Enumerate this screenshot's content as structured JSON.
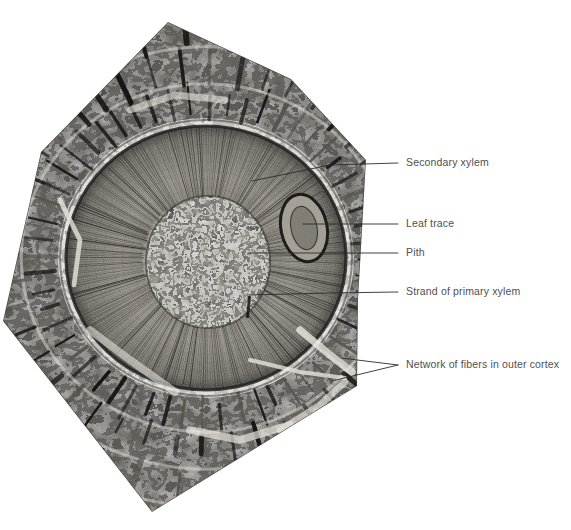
{
  "figure": {
    "kind": "fossil-cross-section-photomicrograph",
    "background_color": "#ffffff",
    "label_color": "#4f4f4f",
    "leader_color": "#2b2b2b",
    "specimen": {
      "shape": "hexagonal-slab",
      "tone_dark": "#1b1b1b",
      "tone_mid": "#7a7a7a",
      "tone_light": "#e6e4de",
      "outline": [
        [
          168,
          22
        ],
        [
          291,
          79
        ],
        [
          366,
          160
        ],
        [
          358,
          300
        ],
        [
          357,
          386
        ],
        [
          152,
          512
        ],
        [
          3,
          321
        ],
        [
          41,
          152
        ]
      ]
    },
    "regions": {
      "pith": {
        "cx": 208,
        "cy": 262,
        "rx": 62,
        "ry": 66
      },
      "secondary_xylem": {
        "cx": 206,
        "cy": 258,
        "rx": 140,
        "ry": 132
      },
      "outer_cortex": {
        "note": "network of fibers ring"
      },
      "leaf_trace": {
        "cx": 304,
        "cy": 228,
        "rx": 22,
        "ry": 33
      }
    }
  },
  "labels": [
    {
      "id": "secondary-xylem",
      "text": "Secondary xylem",
      "x": 406,
      "y": 157
    },
    {
      "id": "leaf-trace",
      "text": "Leaf trace",
      "x": 406,
      "y": 218
    },
    {
      "id": "pith",
      "text": "Pith",
      "x": 406,
      "y": 247
    },
    {
      "id": "strand-of-primary-xylem",
      "text": "Strand of primary xylem",
      "x": 406,
      "y": 286
    },
    {
      "id": "network-of-fibers",
      "text": "Network of fibers in outer cortex",
      "x": 406,
      "y": 359
    }
  ],
  "leaders": [
    {
      "id": "leader-secondary-xylem",
      "points": [
        [
          252,
          181
        ],
        [
          330,
          165
        ],
        [
          398,
          163
        ]
      ]
    },
    {
      "id": "leader-leaf-trace",
      "points": [
        [
          303,
          224
        ],
        [
          398,
          224
        ]
      ]
    },
    {
      "id": "leader-pith",
      "points": [
        [
          250,
          253
        ],
        [
          398,
          253
        ]
      ]
    },
    {
      "id": "leader-strand-primary",
      "points": [
        [
          249,
          295
        ],
        [
          330,
          293
        ],
        [
          398,
          292
        ]
      ]
    },
    {
      "id": "leader-fibers-upper",
      "points": [
        [
          341,
          358
        ],
        [
          398,
          365
        ]
      ]
    },
    {
      "id": "leader-fibers-lower",
      "points": [
        [
          332,
          381
        ],
        [
          398,
          365
        ]
      ]
    }
  ]
}
